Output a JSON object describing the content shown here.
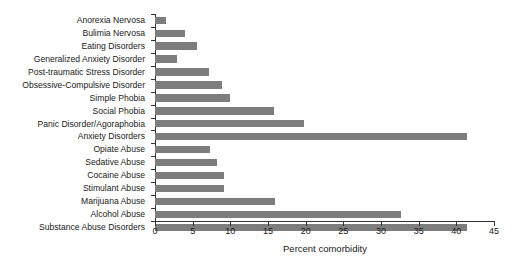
{
  "chart_data": {
    "type": "bar",
    "orientation": "horizontal",
    "title": "",
    "xlabel": "Percent comorbidity",
    "ylabel": "",
    "xlim": [
      0,
      45
    ],
    "xticks": [
      0,
      5,
      10,
      15,
      20,
      25,
      30,
      35,
      40,
      45
    ],
    "grid": false,
    "legend": null,
    "bar_color": "#7d7d7d",
    "categories": [
      "Anorexia Nervosa",
      "Bulimia Nervosa",
      "Eating Disorders",
      "Generalized Anxiety Disorder",
      "Post-traumatic Stress Disorder",
      "Obsessive-Compulsive Disorder",
      "Simple Phobia",
      "Social Phobia",
      "Panic Disorder/Agoraphobia",
      "Anxiety Disorders",
      "Opiate Abuse",
      "Sedative Abuse",
      "Cocaine Abuse",
      "Stimulant Abuse",
      "Marijuana Abuse",
      "Alcohol Abuse",
      "Substance Abuse Disorders"
    ],
    "values": [
      1.5,
      4.0,
      5.6,
      2.9,
      7.2,
      8.9,
      10.0,
      15.8,
      19.8,
      41.4,
      7.3,
      8.2,
      9.2,
      9.2,
      15.9,
      32.7,
      41.4
    ]
  }
}
